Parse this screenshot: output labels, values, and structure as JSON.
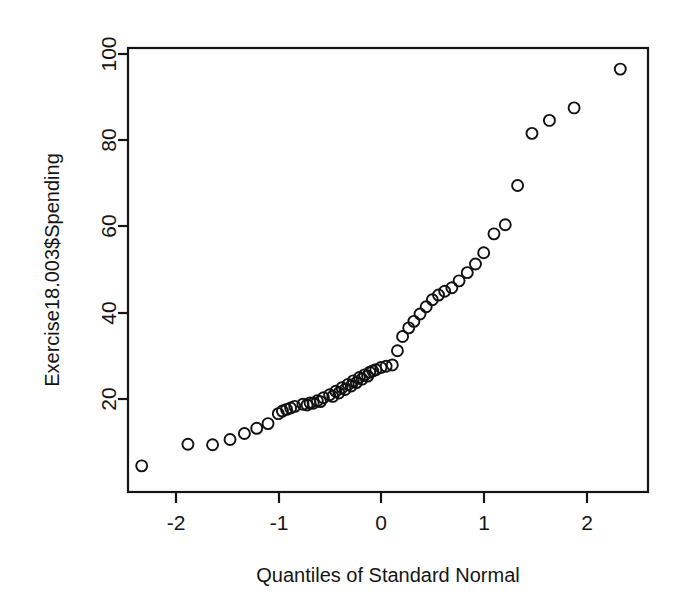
{
  "chart_data": {
    "type": "scatter",
    "title": "",
    "subtitle": "",
    "xlabel": "Quantiles of Standard Normal",
    "ylabel": "Exercise18.003$Spending",
    "xlim": [
      -2.62,
      2.62
    ],
    "ylim": [
      -0.5,
      101.5
    ],
    "xticks": [
      -2,
      -1,
      0,
      1,
      2
    ],
    "xticklabels": [
      "-2",
      "-1",
      "0",
      "1",
      "2"
    ],
    "yticks": [
      20,
      40,
      60,
      80,
      100
    ],
    "yticklabels": [
      "20",
      "40",
      "60",
      "80",
      "100"
    ],
    "grid": false,
    "legend": null,
    "marker": "open-circle",
    "marker_size_px": 11,
    "n_points": 60,
    "series": [
      {
        "name": "Spending vs Normal Quantiles",
        "x": [
          -2.33,
          -1.88,
          -1.64,
          -1.47,
          -1.33,
          -1.21,
          -1.1,
          -1.0,
          -0.92,
          -0.84,
          -0.76,
          -0.69,
          -0.62,
          -0.56,
          -0.5,
          -0.44,
          -0.38,
          -0.32,
          -0.27,
          -0.21,
          -0.16,
          -0.11,
          -0.05,
          0.0,
          0.05,
          0.11,
          0.16,
          0.21,
          0.27,
          0.32,
          0.38,
          0.44,
          0.5,
          0.56,
          0.62,
          0.69,
          0.76,
          0.84,
          0.92,
          1.0,
          1.1,
          1.21,
          1.33,
          1.47,
          1.64,
          1.88,
          2.33,
          -0.96,
          -0.88,
          -0.72,
          -0.66,
          -0.59,
          -0.47,
          -0.41,
          -0.35,
          -0.29,
          -0.24,
          -0.185,
          -0.13,
          -0.08
        ],
        "y": [
          4.5,
          9.5,
          9.4,
          10.6,
          12.0,
          13.2,
          14.3,
          16.6,
          17.6,
          18.3,
          18.8,
          19.1,
          19.6,
          20.3,
          21.0,
          21.8,
          22.6,
          23.4,
          24.2,
          25.0,
          25.6,
          26.2,
          26.8,
          27.3,
          27.6,
          27.9,
          31.2,
          34.5,
          36.5,
          38.0,
          39.7,
          41.4,
          43.0,
          44.1,
          45.0,
          45.8,
          47.4,
          49.3,
          51.3,
          53.9,
          58.3,
          60.4,
          69.5,
          81.6,
          84.6,
          87.5,
          96.5,
          17.2,
          17.9,
          18.6,
          19.0,
          19.4,
          20.6,
          21.4,
          22.2,
          23.0,
          23.8,
          24.6,
          25.3,
          26.5
        ]
      }
    ]
  },
  "axes": {
    "y_axis_label": "Exercise18.003$Spending",
    "x_axis_label": "Quantiles of Standard Normal",
    "y_tick_100": "100",
    "y_tick_80": "80",
    "y_tick_60": "60",
    "y_tick_40": "40",
    "y_tick_20": "20",
    "x_tick_neg2": "-2",
    "x_tick_neg1": "-1",
    "x_tick_0": "0",
    "x_tick_1": "1",
    "x_tick_2": "2"
  },
  "colors": {
    "background": "#ffffff",
    "axis": "#151515",
    "marker_stroke": "#111111",
    "text": "#151515"
  }
}
